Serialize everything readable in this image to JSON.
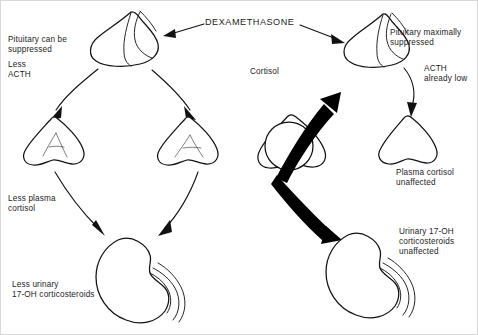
{
  "diagram": {
    "title": "DEXAMETHASONE",
    "width": 478,
    "height": 335,
    "ink_color": "#111111",
    "background_color": "#ffffff"
  },
  "left_pathway": {
    "name": "suppressible-pathway",
    "pituitary_label": "Pituitary can be\nsuppressed",
    "acth_label": "Less\nACTH",
    "adrenal_label": "Less plasma\ncortisol",
    "kidney_label": "Less urinary\n17-OH corticosteroids"
  },
  "right_pathway": {
    "name": "non-suppressible-pathway",
    "cortisol_label": "Cortisol",
    "pituitary_label": "Pituitary maximally\nsuppressed",
    "acth_label": "ACTH\nalready low",
    "adrenal_label": "Plasma cortisol\nunaffected",
    "kidney_label": "Urinary 17-OH\ncorticosteroids\nunaffected"
  },
  "organs": {
    "pituitary_left": "pituitary-gland-icon",
    "pituitary_right": "pituitary-gland-icon",
    "adrenal_left": "adrenal-gland-icon",
    "adrenal_middle": "adrenal-gland-icon",
    "adrenal_tumor": "adrenal-tumor-icon",
    "adrenal_right": "adrenal-gland-icon",
    "kidney_left": "kidney-icon",
    "kidney_right": "kidney-icon"
  },
  "arrows": {
    "dexamethasone_to_left_pituitary": "arrow-thin",
    "dexamethasone_to_right_pituitary": "arrow-thin",
    "left_pituitary_to_left_adrenal": "arrow-curved",
    "left_pituitary_to_middle_adrenal": "arrow-curved",
    "left_adrenal_to_kidney": "arrow-curved",
    "middle_adrenal_to_kidney": "arrow-curved",
    "tumor_to_right_pituitary": "arrow-bold",
    "right_pituitary_to_right_adrenal": "arrow-curved",
    "tumor_to_right_kidney": "arrow-bold"
  }
}
